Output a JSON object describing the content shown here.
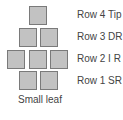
{
  "diagram": {
    "caption": "Small leaf",
    "colors": {
      "square_fill": "#c2c2c2",
      "square_border": "#7a7a7a",
      "text": "#444444"
    },
    "rows": [
      {
        "label": "Row 4 Tip",
        "squares": 1
      },
      {
        "label": "Row 3 DR",
        "squares": 2
      },
      {
        "label": "Row 2 I R",
        "squares": 3
      },
      {
        "label": "Row 1 SR",
        "squares": 2
      }
    ]
  }
}
